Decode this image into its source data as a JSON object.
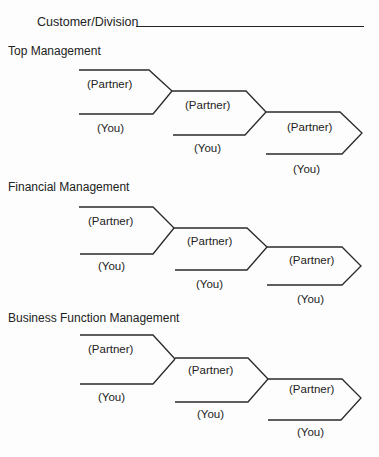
{
  "header": {
    "customer_label": "Customer/Division"
  },
  "sections": [
    {
      "title": "Top Management",
      "labels": {
        "partner": "(Partner)",
        "you": "(You)"
      }
    },
    {
      "title": "Financial Management",
      "labels": {
        "partner": "(Partner)",
        "you": "(You)"
      }
    },
    {
      "title": "Business Function Management",
      "labels": {
        "partner": "(Partner)",
        "you": "(You)"
      }
    }
  ]
}
